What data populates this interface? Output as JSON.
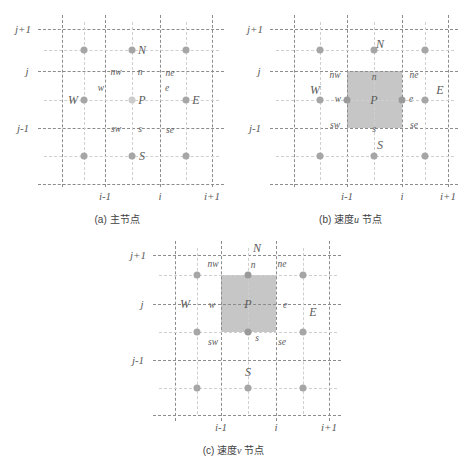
{
  "figure": {
    "title": "",
    "panels": [
      {
        "id": "a",
        "caption_prefix": "(a)",
        "caption_text": "主节点",
        "caption_italic": "",
        "caption_suffix": "",
        "shaded": false,
        "axis_y": [
          "j+1",
          "j",
          "j-1"
        ],
        "axis_x": [
          "i-1",
          "i",
          "i+1"
        ],
        "major_nodes": [
          "N",
          "W",
          "P",
          "E",
          "S"
        ],
        "minor_nodes": [
          "nw",
          "n",
          "ne",
          "w",
          "e",
          "sw",
          "s",
          "se"
        ],
        "labels": {
          "N": "N",
          "S": "S",
          "E": "E",
          "W": "W",
          "P": "P",
          "n": "n",
          "s": "s",
          "e": "e",
          "w": "w",
          "nw": "nw",
          "ne": "ne",
          "sw": "sw",
          "se": "se"
        }
      },
      {
        "id": "b",
        "caption_prefix": "(b)",
        "caption_text": "速度",
        "caption_italic": "u",
        "caption_suffix": "节点",
        "shaded": true,
        "axis_y": [
          "j+1",
          "j",
          "j-1"
        ],
        "axis_x": [
          "i-1",
          "i",
          "i+1"
        ],
        "major_nodes": [
          "N",
          "W",
          "P",
          "E",
          "S"
        ],
        "minor_nodes": [
          "nw",
          "n",
          "ne",
          "w",
          "e",
          "sw",
          "s",
          "se"
        ],
        "labels": {
          "N": "N",
          "S": "S",
          "E": "E",
          "W": "W",
          "P": "P",
          "n": "n",
          "s": "s",
          "e": "e",
          "w": "w",
          "nw": "nw",
          "ne": "ne",
          "sw": "sw",
          "se": "se"
        }
      },
      {
        "id": "c",
        "caption_prefix": "(c)",
        "caption_text": "速度",
        "caption_italic": "v",
        "caption_suffix": "节点",
        "shaded": true,
        "axis_y": [
          "j+1",
          "j",
          "j-1"
        ],
        "axis_x": [
          "i-1",
          "i",
          "i+1"
        ],
        "major_nodes": [
          "N",
          "W",
          "P",
          "E",
          "S"
        ],
        "minor_nodes": [
          "nw",
          "n",
          "ne",
          "w",
          "e",
          "sw",
          "s",
          "se"
        ],
        "labels": {
          "N": "N",
          "S": "S",
          "E": "E",
          "W": "W",
          "P": "P",
          "n": "n",
          "s": "s",
          "e": "e",
          "w": "w",
          "nw": "nw",
          "ne": "ne",
          "sw": "sw",
          "se": "se"
        }
      }
    ],
    "colors": {
      "major_grid": "#8c8c8c",
      "minor_grid": "#cfcfcf",
      "node": "#a6a6a6",
      "shade": "#bcbcbc",
      "text": "#5a5a5a"
    }
  }
}
